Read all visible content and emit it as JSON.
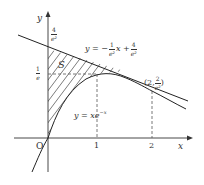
{
  "figure": {
    "axes": {
      "x_label": "x",
      "y_label": "y",
      "origin_label": "O",
      "x_ticks": [
        "1",
        "2"
      ]
    },
    "y_labels": {
      "four_over_e2": {
        "num": "4",
        "den": "e²"
      },
      "one_over_e": {
        "num": "1",
        "den": "e"
      }
    },
    "region_label": "S",
    "curves": {
      "tangent_line": {
        "pre": "y = −",
        "frac_num": "1",
        "frac_den": "e²",
        "mid": "x +",
        "frac2_num": "4",
        "frac2_den": "e²"
      },
      "function_curve": "y = xe",
      "function_exp": "−x"
    },
    "point_label": {
      "pre": "(2, ",
      "num": "2",
      "den": "e²",
      "post": ")"
    }
  }
}
